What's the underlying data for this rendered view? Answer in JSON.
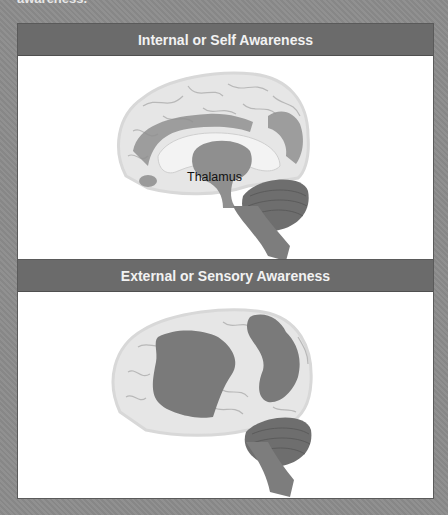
{
  "caption_fragment": "awareness.",
  "panels": [
    {
      "title": "Internal or Self Awareness",
      "figure": "brain-medial-view",
      "labels": [
        "Thalamus"
      ],
      "highlighted_regions": [
        "cingulate/medial frontal region",
        "precuneus region",
        "thalamus"
      ]
    },
    {
      "title": "External or Sensory Awareness",
      "figure": "brain-lateral-view",
      "labels": [],
      "highlighted_regions": [
        "lateral frontal region",
        "lateral parietal region"
      ]
    }
  ],
  "colors": {
    "background": "#8c8c8c",
    "header": "#6b6b6b",
    "header_text": "#f2f2f2",
    "brain_light": "#e4e4e4",
    "brain_highlight": "#8a8a8a",
    "cerebellum": "#6e6e6e"
  }
}
